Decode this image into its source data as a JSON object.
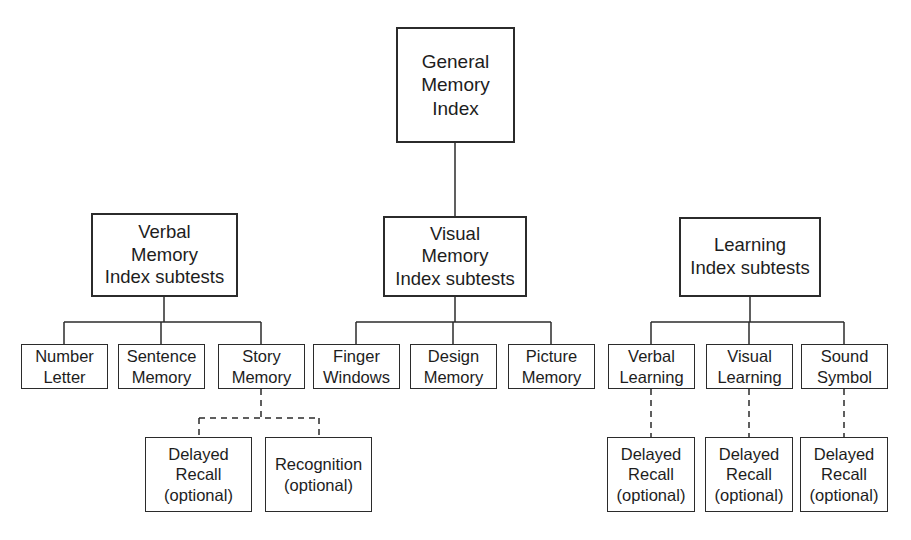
{
  "diagram": {
    "background_color": "#ffffff",
    "line_color": "#2b2b2b",
    "text_color": "#1d1d1d"
  },
  "nodes": {
    "general_memory_index": {
      "lines": [
        "General",
        "Memory",
        "Index"
      ],
      "x": 396,
      "y": 27,
      "w": 119,
      "h": 116
    },
    "verbal_memory_index": {
      "lines": [
        "Verbal",
        "Memory",
        "Index subtests"
      ],
      "x": 91,
      "y": 213,
      "w": 147,
      "h": 84
    },
    "visual_memory_index": {
      "lines": [
        "Visual",
        "Memory",
        "Index subtests"
      ],
      "x": 383,
      "y": 216,
      "w": 144,
      "h": 81
    },
    "learning_index": {
      "lines": [
        "Learning",
        "Index subtests"
      ],
      "x": 679,
      "y": 217,
      "w": 142,
      "h": 80
    },
    "number_letter": {
      "lines": [
        "Number",
        "Letter"
      ],
      "x": 21,
      "y": 344,
      "w": 87,
      "h": 45
    },
    "sentence_memory": {
      "lines": [
        "Sentence",
        "Memory"
      ],
      "x": 118,
      "y": 344,
      "w": 87,
      "h": 45
    },
    "story_memory": {
      "lines": [
        "Story",
        "Memory"
      ],
      "x": 218,
      "y": 344,
      "w": 87,
      "h": 45
    },
    "finger_windows": {
      "lines": [
        "Finger",
        "Windows"
      ],
      "x": 313,
      "y": 344,
      "w": 87,
      "h": 45
    },
    "design_memory": {
      "lines": [
        "Design",
        "Memory"
      ],
      "x": 410,
      "y": 344,
      "w": 87,
      "h": 45
    },
    "picture_memory": {
      "lines": [
        "Picture",
        "Memory"
      ],
      "x": 508,
      "y": 344,
      "w": 87,
      "h": 45
    },
    "verbal_learning": {
      "lines": [
        "Verbal",
        "Learning"
      ],
      "x": 608,
      "y": 344,
      "w": 87,
      "h": 45
    },
    "visual_learning": {
      "lines": [
        "Visual",
        "Learning"
      ],
      "x": 706,
      "y": 344,
      "w": 87,
      "h": 45
    },
    "sound_symbol": {
      "lines": [
        "Sound",
        "Symbol"
      ],
      "x": 801,
      "y": 344,
      "w": 87,
      "h": 45
    },
    "story_delayed_recall": {
      "lines": [
        "Delayed",
        "Recall",
        "(optional)"
      ],
      "x": 145,
      "y": 437,
      "w": 107,
      "h": 75
    },
    "story_recognition": {
      "lines": [
        "Recognition",
        "(optional)"
      ],
      "x": 265,
      "y": 437,
      "w": 107,
      "h": 75
    },
    "verbal_learning_delayed_recall": {
      "lines": [
        "Delayed",
        "Recall",
        "(optional)"
      ],
      "x": 607,
      "y": 437,
      "w": 88,
      "h": 75
    },
    "visual_learning_delayed_recall": {
      "lines": [
        "Delayed",
        "Recall",
        "(optional)"
      ],
      "x": 705,
      "y": 437,
      "w": 88,
      "h": 75
    },
    "sound_symbol_delayed_recall": {
      "lines": [
        "Delayed",
        "Recall",
        "(optional)"
      ],
      "x": 800,
      "y": 437,
      "w": 88,
      "h": 75
    }
  },
  "connectors": {
    "solid": [
      {
        "name": "general-to-visual",
        "x1": 455,
        "y1": 143,
        "x2": 455,
        "y2": 216
      },
      {
        "name": "verbal-stem",
        "x1": 164,
        "y1": 297,
        "x2": 164,
        "y2": 322
      },
      {
        "name": "verbal-bus",
        "x1": 64,
        "y1": 322,
        "x2": 261,
        "y2": 322
      },
      {
        "name": "verbal-drop-number-letter",
        "x1": 64,
        "y1": 322,
        "x2": 64,
        "y2": 344
      },
      {
        "name": "verbal-drop-sentence-memory",
        "x1": 161,
        "y1": 322,
        "x2": 161,
        "y2": 344
      },
      {
        "name": "verbal-drop-story-memory",
        "x1": 261,
        "y1": 322,
        "x2": 261,
        "y2": 344
      },
      {
        "name": "visual-stem",
        "x1": 455,
        "y1": 297,
        "x2": 455,
        "y2": 322
      },
      {
        "name": "visual-bus",
        "x1": 356,
        "y1": 322,
        "x2": 551,
        "y2": 322
      },
      {
        "name": "visual-drop-finger-windows",
        "x1": 356,
        "y1": 322,
        "x2": 356,
        "y2": 344
      },
      {
        "name": "visual-drop-design-memory",
        "x1": 453,
        "y1": 322,
        "x2": 453,
        "y2": 344
      },
      {
        "name": "visual-drop-picture-memory",
        "x1": 551,
        "y1": 322,
        "x2": 551,
        "y2": 344
      },
      {
        "name": "learning-stem",
        "x1": 750,
        "y1": 297,
        "x2": 750,
        "y2": 322
      },
      {
        "name": "learning-bus",
        "x1": 651,
        "y1": 322,
        "x2": 844,
        "y2": 322
      },
      {
        "name": "learning-drop-verbal-learning",
        "x1": 651,
        "y1": 322,
        "x2": 651,
        "y2": 344
      },
      {
        "name": "learning-drop-visual-learning",
        "x1": 749,
        "y1": 322,
        "x2": 749,
        "y2": 344
      },
      {
        "name": "learning-drop-sound-symbol",
        "x1": 844,
        "y1": 322,
        "x2": 844,
        "y2": 344
      }
    ],
    "dashed": [
      {
        "name": "story-memory-stem",
        "x1": 261,
        "y1": 389,
        "x2": 261,
        "y2": 418
      },
      {
        "name": "story-memory-bus",
        "x1": 199,
        "y1": 418,
        "x2": 319,
        "y2": 418
      },
      {
        "name": "story-drop-delayed-recall",
        "x1": 199,
        "y1": 418,
        "x2": 199,
        "y2": 437
      },
      {
        "name": "story-drop-recognition",
        "x1": 319,
        "y1": 418,
        "x2": 319,
        "y2": 437
      },
      {
        "name": "verbal-learning-to-delayed-recall",
        "x1": 651,
        "y1": 389,
        "x2": 651,
        "y2": 437
      },
      {
        "name": "visual-learning-to-delayed-recall",
        "x1": 749,
        "y1": 389,
        "x2": 749,
        "y2": 437
      },
      {
        "name": "sound-symbol-to-delayed-recall",
        "x1": 844,
        "y1": 389,
        "x2": 844,
        "y2": 437
      }
    ]
  }
}
